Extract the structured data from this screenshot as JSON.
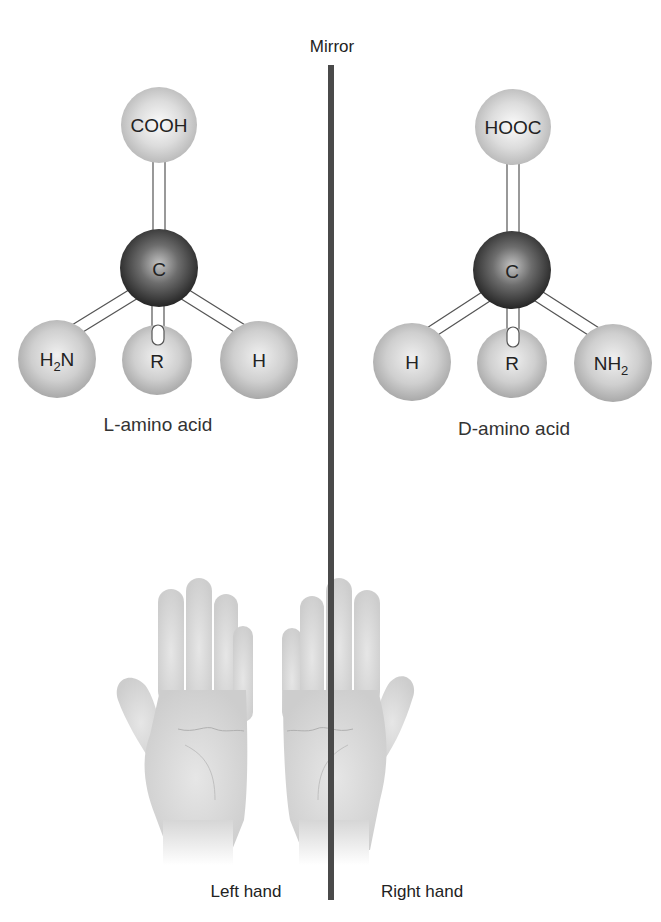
{
  "diagram": {
    "mirror": {
      "label": "Mirror",
      "color": "#4a4a4a"
    },
    "molecules": [
      {
        "id": "l-amino-acid",
        "caption_prefix": "L",
        "caption_suffix": "-amino acid",
        "center": {
          "label": "C"
        },
        "top": {
          "label": "COOH"
        },
        "left": {
          "label": "H",
          "sub": "2",
          "tail": "N"
        },
        "middle": {
          "label": "R"
        },
        "right": {
          "label": "H"
        }
      },
      {
        "id": "d-amino-acid",
        "caption_prefix": "D",
        "caption_suffix": "-amino acid",
        "center": {
          "label": "C"
        },
        "top": {
          "label": "HOOC"
        },
        "left": {
          "label": "H"
        },
        "middle": {
          "label": "R"
        },
        "right": {
          "label": "NH",
          "sub": "2"
        }
      }
    ],
    "hands": [
      {
        "id": "left-hand",
        "label": "Left hand"
      },
      {
        "id": "right-hand",
        "label": "Right hand"
      }
    ],
    "colors": {
      "carbon_dark": "#2e2e2e",
      "carbon_light": "#b8b8b8",
      "group_light": "#f4f4f4",
      "group_dark": "#b9b9b9",
      "hand_fill": "#d9d9d9",
      "bond_stroke": "#555555"
    }
  }
}
